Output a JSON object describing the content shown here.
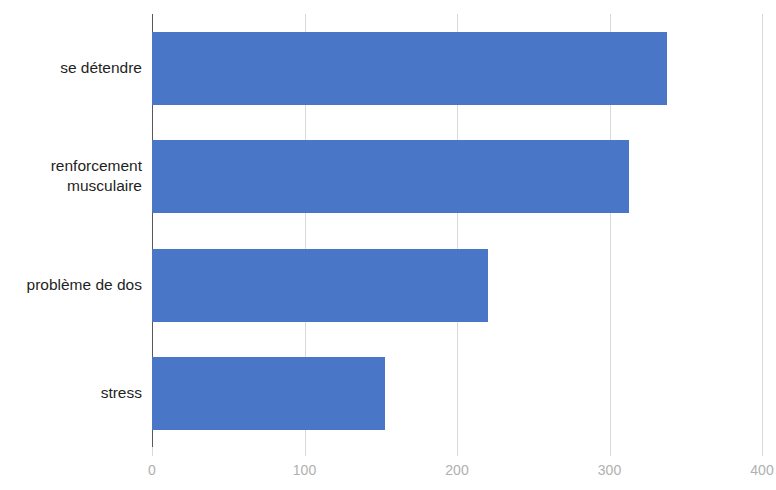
{
  "chart_data": {
    "type": "bar",
    "orientation": "horizontal",
    "title": "",
    "subtitle": "",
    "xlabel": "",
    "ylabel": "",
    "categories": [
      "se détendre",
      "renforcement\nmusculaire",
      "problème de dos",
      "stress"
    ],
    "values": [
      338,
      313,
      220,
      153
    ],
    "series": [
      {
        "name": "",
        "values": [
          338,
          313,
          220,
          153
        ]
      }
    ],
    "xlim": [
      0,
      400
    ],
    "ylim": null,
    "xticks": [
      0,
      100,
      200,
      300,
      400
    ],
    "xtick_labels": [
      "0",
      "100",
      "200",
      "300",
      "400"
    ],
    "grid": "vertical",
    "legend": "none",
    "bar_color": "#4a76c8",
    "gridline_color": "#d9d9d9",
    "axis_color": "#595959",
    "tick_label_color": "#b0b0b0",
    "category_label_color": "#1f1f1f",
    "background": "#ffffff",
    "annotations": []
  }
}
